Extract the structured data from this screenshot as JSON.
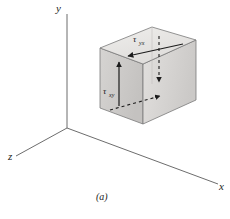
{
  "figure": {
    "caption": "(a)",
    "background_color": "#ffffff",
    "line_color": "#4a4a4a",
    "arrow_color": "#1c1c1c",
    "axes": {
      "y_label": "y",
      "x_label": "x",
      "z_label": "z",
      "origin_label": ""
    },
    "cube": {
      "top_face_color": "#e6e4e2",
      "left_face_color": "#cfcdcb",
      "right_face_color": "#dcdad8",
      "edge_color": "#6b6b6b"
    },
    "stresses": [
      {
        "name": "tau-yx-top",
        "symbol": "τ",
        "subscript": "yx",
        "face": "top",
        "style": "solid",
        "direction": "toward-viewer-left"
      },
      {
        "name": "tau-xy-left",
        "symbol": "τ",
        "subscript": "xy",
        "face": "left-front",
        "style": "solid",
        "direction": "up"
      },
      {
        "name": "tau-yx-hidden",
        "symbol": "",
        "subscript": "",
        "face": "bottom-hidden",
        "style": "dashed",
        "direction": "toward-right"
      },
      {
        "name": "tau-xy-hidden",
        "symbol": "",
        "subscript": "",
        "face": "right-hidden",
        "style": "dashed",
        "direction": "down"
      }
    ]
  }
}
